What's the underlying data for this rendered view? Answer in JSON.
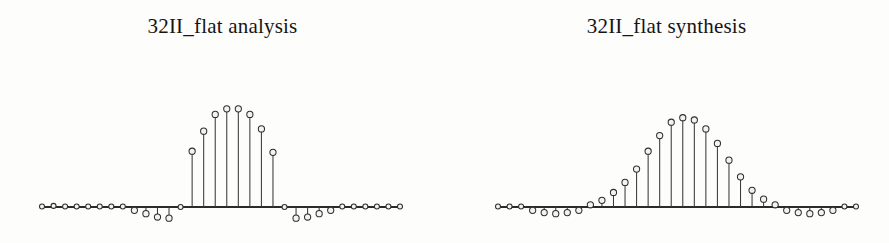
{
  "figure": {
    "background_color": "#fdfdfc",
    "ink_color": "#2b2b2b",
    "marker_fill_color": "#f4f3f1"
  },
  "panels": [
    {
      "id": "analysis",
      "title": "32II_flat analysis",
      "axis": {
        "x_start": 42,
        "x_end": 400,
        "baseline_y": 207
      }
    },
    {
      "id": "synthesis",
      "title": "32II_flat synthesis",
      "axis": {
        "x_start": 54,
        "x_end": 412,
        "baseline_y": 207
      }
    }
  ],
  "chart_data": [
    {
      "type": "scatter",
      "plot_style": "stem",
      "title": "32II_flat analysis",
      "xlabel": "",
      "ylabel": "",
      "grid": false,
      "legend": null,
      "axis_baseline_value": 0,
      "x": [
        0,
        1,
        2,
        3,
        4,
        5,
        6,
        7,
        8,
        9,
        10,
        11,
        12,
        13,
        14,
        15,
        16,
        17,
        18,
        19,
        20,
        21,
        22,
        23,
        24,
        25,
        26,
        27,
        28,
        29,
        30,
        31
      ],
      "values": [
        0.005,
        0.01,
        0.005,
        0.005,
        0.005,
        0.005,
        0.005,
        0.005,
        -0.03,
        -0.06,
        -0.09,
        -0.1,
        0.0,
        0.5,
        0.68,
        0.83,
        0.88,
        0.88,
        0.83,
        0.7,
        0.49,
        0.0,
        -0.1,
        -0.09,
        -0.06,
        -0.03,
        0.005,
        0.005,
        0.005,
        0.005,
        0.005,
        0.005
      ],
      "ylim": [
        -0.15,
        0.95
      ]
    },
    {
      "type": "scatter",
      "plot_style": "stem",
      "title": "32II_flat synthesis",
      "xlabel": "",
      "ylabel": "",
      "grid": false,
      "legend": null,
      "axis_baseline_value": 0,
      "x": [
        0,
        1,
        2,
        3,
        4,
        5,
        6,
        7,
        8,
        9,
        10,
        11,
        12,
        13,
        14,
        15,
        16,
        17,
        18,
        19,
        20,
        21,
        22,
        23,
        24,
        25,
        26,
        27,
        28,
        29,
        30,
        31
      ],
      "values": [
        0.005,
        0.005,
        0.005,
        -0.03,
        -0.05,
        -0.06,
        -0.05,
        -0.03,
        0.02,
        0.06,
        0.13,
        0.22,
        0.34,
        0.5,
        0.64,
        0.76,
        0.8,
        0.78,
        0.7,
        0.57,
        0.42,
        0.27,
        0.15,
        0.07,
        0.02,
        -0.03,
        -0.05,
        -0.06,
        -0.05,
        -0.03,
        0.005,
        0.005
      ],
      "ylim": [
        -0.15,
        0.95
      ]
    }
  ]
}
